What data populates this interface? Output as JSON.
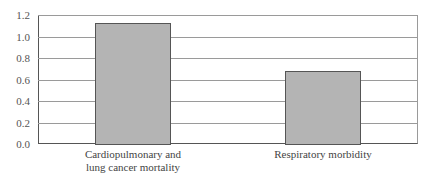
{
  "chart_data": {
    "type": "bar",
    "title": "",
    "xlabel": "",
    "ylabel": "",
    "categories": [
      "Cardiopulmonary and lung cancer mortality",
      "Respiratory morbidity"
    ],
    "category_lines": [
      [
        "Cardiopulmonary and",
        "lung cancer mortality"
      ],
      [
        "Respiratory morbidity"
      ]
    ],
    "values": [
      1.13,
      0.68
    ],
    "ylim": [
      0,
      1.2
    ],
    "yticks": [
      "0.0",
      "0.2",
      "0.4",
      "0.6",
      "0.8",
      "1.0",
      "1.2"
    ],
    "grid": true,
    "legend": null,
    "bar_color": "#b4b4b4",
    "bar_edge_color": "#555555"
  }
}
